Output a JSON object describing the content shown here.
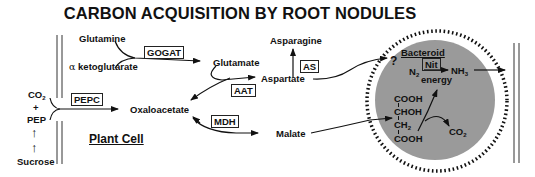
{
  "title": "CARBON ACQUISITION BY ROOT NODULES",
  "regions": {
    "plant_cell": "Plant Cell",
    "bacteroid": "Bacteroid"
  },
  "metabolites": {
    "glutamine": "Glutamine",
    "alpha_symbol": "α",
    "ketoglutarate": "ketoglutarate",
    "glutamate": "Glutamate",
    "asparagine": "Asparagine",
    "aspartate": "Aspartate",
    "oxaloacetate": "Oxaloacetate",
    "malate": "Malate",
    "co2_left": "CO",
    "co2_left_sub": "2",
    "plus": "+",
    "pep": "PEP",
    "sucrose": "Sucrose",
    "unknown": "?",
    "n2": "N",
    "n2_sub": "2",
    "nh3": "NH",
    "nh3_sub": "3",
    "energy": "energy",
    "co2_right": "CO",
    "co2_right_sub": "2",
    "up_arrow_1": "↑",
    "up_arrow_2": "↑"
  },
  "malate_structure": {
    "line1": "COOH",
    "line2": "CHOH",
    "line3": "CH",
    "line3_sub": "2",
    "line4": "COOH"
  },
  "enzymes": {
    "gogat": "GOGAT",
    "as": "AS",
    "aat": "AAT",
    "pepc": "PEPC",
    "mdh": "MDH",
    "nit": "Nit"
  },
  "colors": {
    "bacteroid_fill": "#9a9a9a",
    "ink": "#111111"
  }
}
